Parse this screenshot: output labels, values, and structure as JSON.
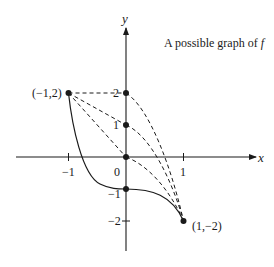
{
  "title": {
    "prefix": "A possible graph of ",
    "func": "f"
  },
  "axes": {
    "x_label": "x",
    "y_label": "y",
    "x_ticks": [
      {
        "value": -1,
        "label": "−1"
      },
      {
        "value": 0,
        "label": "0"
      },
      {
        "value": 1,
        "label": "1"
      }
    ],
    "y_ticks": [
      {
        "value": 2,
        "label": "2"
      },
      {
        "value": 1,
        "label": "1"
      },
      {
        "value": -1,
        "label": "−1"
      },
      {
        "value": -2,
        "label": "−2"
      }
    ]
  },
  "points": [
    {
      "x": -1,
      "y": 2,
      "label": "(−1,2)"
    },
    {
      "x": 0,
      "y": 2,
      "label": ""
    },
    {
      "x": 0,
      "y": 1,
      "label": ""
    },
    {
      "x": 0,
      "y": 0,
      "label": ""
    },
    {
      "x": 0,
      "y": -1,
      "label": ""
    },
    {
      "x": 1,
      "y": -2,
      "label": "(1,−2)"
    }
  ],
  "curves": {
    "solid": "Solid curve from (-1,2) through (0,-1) with horizontal tangent to (1,-2)",
    "dashed": [
      "(-1,2) to (0,2) to (1,-2)",
      "(-1,2) to (0,1) to (1,-2)",
      "(-1,2) to (0,0) to (1,-2)"
    ]
  },
  "colors": {
    "ink": "#1a1a1a",
    "background": "#ffffff"
  }
}
